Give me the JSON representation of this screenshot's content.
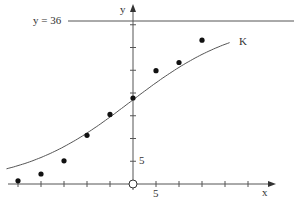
{
  "chart_data": {
    "type": "scatter",
    "title": "",
    "xlabel": "x",
    "ylabel": "y",
    "asymptote_label": "y = 36",
    "asymptote_value": 36,
    "curve_label": "K",
    "x_tick_label": "5",
    "y_tick_label": "5",
    "xlim": [
      -29,
      30
    ],
    "ylim": [
      -2,
      40
    ],
    "x_tick_step": 5,
    "y_tick_step": 5,
    "grid": false,
    "points": [
      {
        "x": -25,
        "y": 0.7
      },
      {
        "x": -20,
        "y": 2.2
      },
      {
        "x": -15,
        "y": 5.1
      },
      {
        "x": -10,
        "y": 10.7
      },
      {
        "x": -5,
        "y": 15.3
      },
      {
        "x": 0,
        "y": 18.9
      },
      {
        "x": 5,
        "y": 24.9
      },
      {
        "x": 10,
        "y": 26.7
      },
      {
        "x": 15,
        "y": 31.6
      }
    ],
    "series": [
      {
        "name": "K",
        "type": "logistic curve",
        "carrying_capacity": 36
      }
    ],
    "origin_marker": "open circle"
  }
}
